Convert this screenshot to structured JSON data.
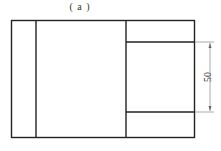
{
  "figure": {
    "caption": "( a )",
    "dimension_label": "50",
    "colors": {
      "line": "#222222",
      "dim_line": "#888888",
      "background": "#ffffff"
    }
  }
}
